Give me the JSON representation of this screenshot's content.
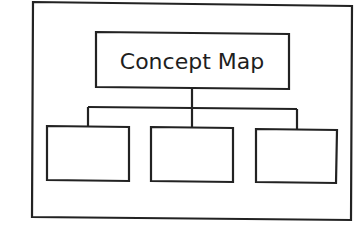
{
  "diagram": {
    "type": "concept-map-template",
    "line_color": "#222222",
    "background_color": "#ffffff",
    "frame": {
      "label": ""
    },
    "root": {
      "label": "Concept Map"
    },
    "children": [
      {
        "label": ""
      },
      {
        "label": ""
      },
      {
        "label": ""
      }
    ]
  }
}
